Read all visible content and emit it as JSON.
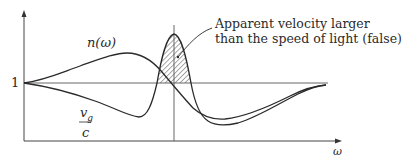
{
  "diagram": {
    "title": "",
    "labels": {
      "y_reference": "1",
      "refractive_index": "n(ω)",
      "group_velocity_numerator": "v",
      "group_velocity_subscript": "g",
      "group_velocity_denominator": "c",
      "x_axis": "ω"
    },
    "annotation": {
      "line1": "Apparent velocity larger",
      "line2": "than the speed of light (false)"
    },
    "curves": [
      {
        "name": "n(ω)",
        "description": "refractive index; rises to a maximum before resonance, drops through resonance to a minimum, then returns toward 1"
      },
      {
        "name": "v_g/c",
        "description": "group velocity ratio; dips below 1, spikes sharply above 1 near resonance (hatched region), dips to minimum, returns toward 1"
      }
    ],
    "hatched_region": "area where v_g/c exceeds 1 near resonance frequency",
    "colors": {
      "ink": "#2a2a2a",
      "background": "#ffffff"
    }
  }
}
